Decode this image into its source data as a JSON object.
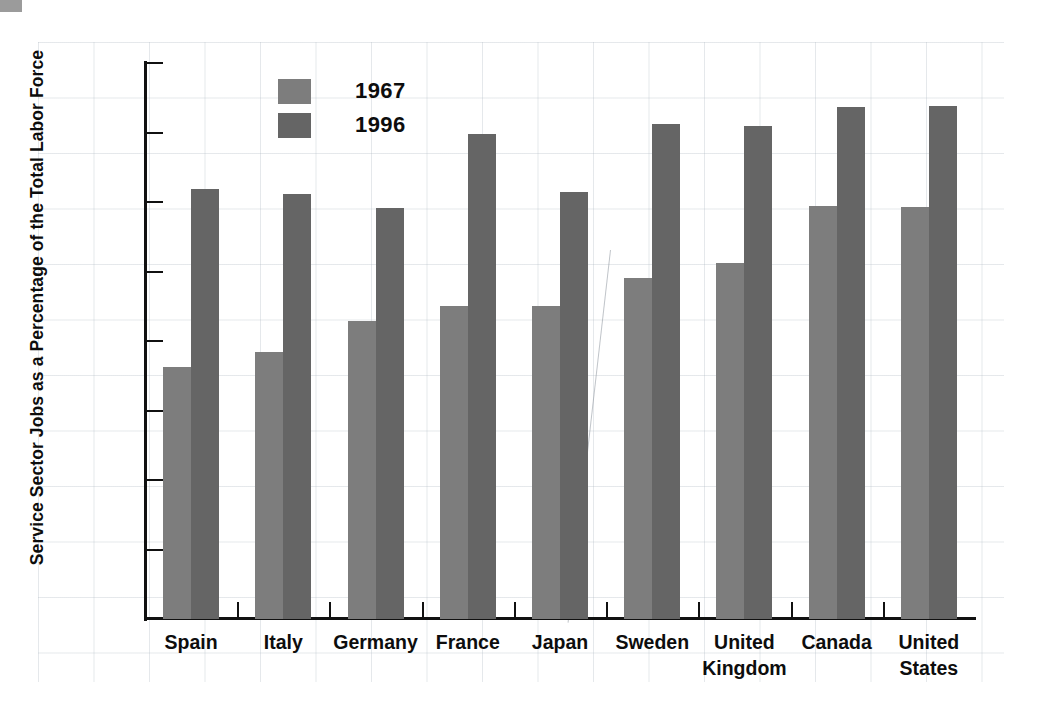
{
  "chart_data": {
    "type": "bar",
    "title": "",
    "xlabel": "",
    "ylabel": "Service Sector Jobs as a Percentage of the Total Labor Force",
    "ylim": [
      0,
      80
    ],
    "yticks": [
      0,
      10,
      20,
      30,
      40,
      50,
      60,
      70,
      80
    ],
    "ytick_labels": [
      "0",
      "10",
      "20",
      "30",
      "40",
      "50",
      "60",
      "70",
      "80%"
    ],
    "grid": false,
    "legend_position": "top-left-inside",
    "categories": [
      "Spain",
      "Italy",
      "Germany",
      "France",
      "Japan",
      "Sweden",
      "United\nKingdom",
      "Canada",
      "United\nStates"
    ],
    "series": [
      {
        "name": "1967",
        "color": "#7d7d7d",
        "values": [
          36.2,
          38.4,
          42.9,
          45.0,
          45.1,
          49.1,
          51.2,
          59.4,
          59.3
        ]
      },
      {
        "name": "1996",
        "color": "#656565",
        "values": [
          61.9,
          61.1,
          59.2,
          69.8,
          61.5,
          71.2,
          70.9,
          73.6,
          73.8
        ]
      }
    ]
  },
  "legend": {
    "items": [
      {
        "label": "1967",
        "color": "#7d7d7d"
      },
      {
        "label": "1996",
        "color": "#656565"
      }
    ]
  },
  "axis": {
    "y_axis_label": "Service Sector Jobs as a Percentage of the Total Labor Force"
  }
}
